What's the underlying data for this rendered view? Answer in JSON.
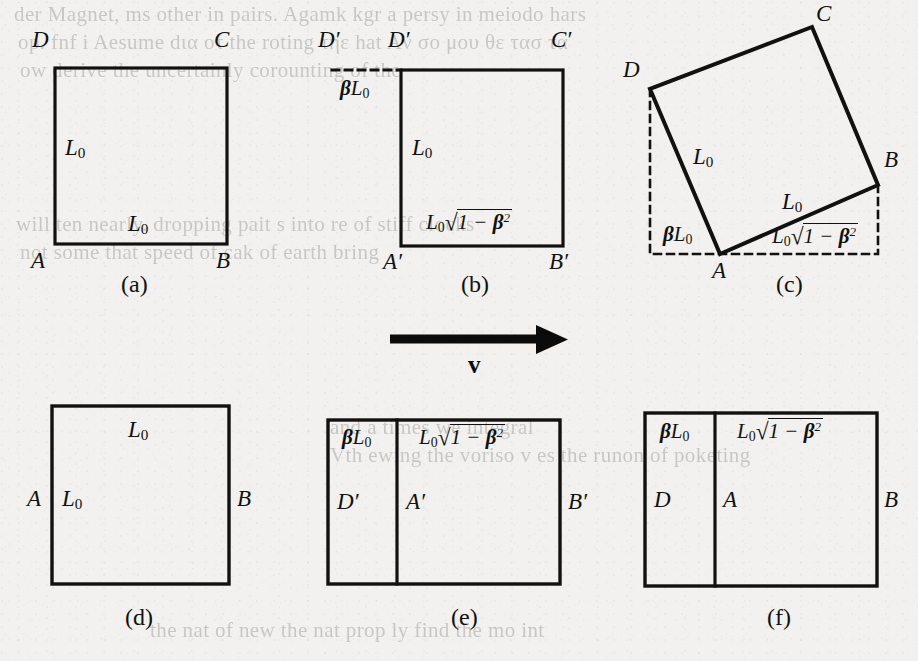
{
  "figure": {
    "paper_color": "#f2f1ef",
    "ink_color": "#111111",
    "panels": [
      {
        "id": "a",
        "caption": "(a)",
        "kind": "square",
        "vertex_labels": [
          "D",
          "C",
          "A",
          "B"
        ],
        "side_labels": [
          "L0",
          "L0"
        ],
        "side_labels_text": [
          "L₀",
          "L₀"
        ]
      },
      {
        "id": "b",
        "caption": "(b)",
        "kind": "rectangle-with-dashed-extension",
        "vertex_labels": [
          "D'",
          "D'",
          "C'",
          "A'",
          "B'"
        ],
        "dashed_label": "βL₀",
        "side_labels_text": [
          "L₀",
          "L₀√(1−β²)"
        ]
      },
      {
        "id": "c",
        "caption": "(c)",
        "kind": "rotated-square-with-bounding-box",
        "vertex_labels": [
          "C",
          "D",
          "B",
          "A"
        ],
        "side_labels_text": [
          "L₀",
          "L₀"
        ],
        "baseline_labels_text": [
          "βL₀",
          "L₀√(1−β²)"
        ]
      },
      {
        "id": "d",
        "caption": "(d)",
        "kind": "square",
        "vertex_labels": [
          "A",
          "B"
        ],
        "side_labels_text": [
          "L₀",
          "L₀"
        ]
      },
      {
        "id": "e",
        "caption": "(e)",
        "kind": "divided-rectangle",
        "vertex_labels": [
          "D'",
          "A'",
          "B'"
        ],
        "section_labels_text": [
          "βL₀",
          "L₀√(1−β²)"
        ]
      },
      {
        "id": "f",
        "caption": "(f)",
        "kind": "divided-rectangle",
        "vertex_labels": [
          "D",
          "A",
          "B"
        ],
        "section_labels_text": [
          "βL₀",
          "L₀√(1−β²)"
        ]
      }
    ],
    "velocity_arrow": {
      "label": "v",
      "direction": "right"
    },
    "labels": {
      "L0": "L",
      "L0_sub": "0",
      "beta": "β",
      "one": "1",
      "minus": "−",
      "beta_sq_base": "β",
      "beta_sq_exp": "2",
      "radical": "√",
      "A": "A",
      "B": "B",
      "C": "C",
      "D": "D",
      "Ap": "A′",
      "Bp": "B′",
      "Cp": "C′",
      "Dp": "D′"
    },
    "captions": {
      "a": "(a)",
      "b": "(b)",
      "c": "(c)",
      "d": "(d)",
      "e": "(e)",
      "f": "(f)"
    },
    "bleedthrough_text": [
      "der Magnet, ms other in pairs. Agamk kgr a persy in   meiodo hars",
      "op. fnf i   Aesume dια   οτ the roting τηε hat Aν   σο μου θε  τασ τα",
      "ow derive the uncertainly corounting of the",
      "will ten nearly. dropping pait s into re of stiff clocks",
      "not some that  speed of cak of earth bring",
      "and a times we  integral",
      "Vth ewing the  voriso v es the runon of poketing",
      "the nat   of new the nat     prop ly   find the mo  int"
    ]
  }
}
